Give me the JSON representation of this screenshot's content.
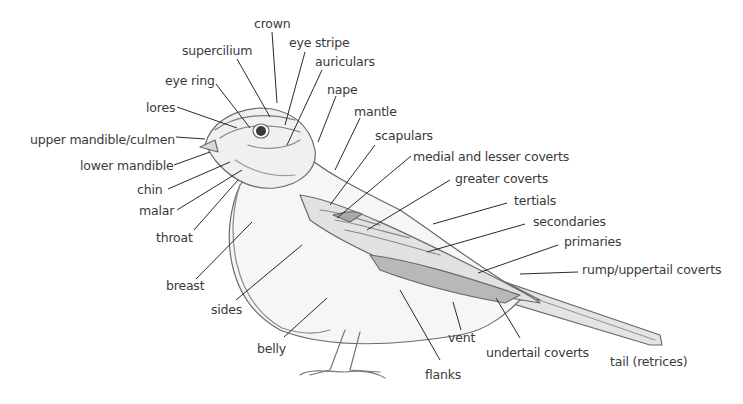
{
  "diagram": {
    "labels": [
      {
        "id": "crown",
        "text": "crown",
        "x": 254,
        "y": 18
      },
      {
        "id": "supercilium",
        "text": "supercilium",
        "x": 182,
        "y": 45
      },
      {
        "id": "eye-stripe",
        "text": "eye stripe",
        "x": 289,
        "y": 37
      },
      {
        "id": "auriculars",
        "text": "auriculars",
        "x": 315,
        "y": 56
      },
      {
        "id": "eye-ring",
        "text": "eye ring",
        "x": 165,
        "y": 75
      },
      {
        "id": "nape",
        "text": "nape",
        "x": 327,
        "y": 84
      },
      {
        "id": "lores",
        "text": "lores",
        "x": 146,
        "y": 102
      },
      {
        "id": "mantle",
        "text": "mantle",
        "x": 354,
        "y": 106
      },
      {
        "id": "upper-mandible",
        "text": "upper mandible/culmen",
        "x": 30,
        "y": 134
      },
      {
        "id": "scapulars",
        "text": "scapulars",
        "x": 375,
        "y": 130
      },
      {
        "id": "medial-lesser-coverts",
        "text": "medial and lesser coverts",
        "x": 413,
        "y": 151
      },
      {
        "id": "lower-mandible",
        "text": "lower mandible",
        "x": 80,
        "y": 160
      },
      {
        "id": "greater-coverts",
        "text": "greater coverts",
        "x": 455,
        "y": 173
      },
      {
        "id": "chin",
        "text": "chin",
        "x": 137,
        "y": 184
      },
      {
        "id": "tertials",
        "text": "tertials",
        "x": 514,
        "y": 195
      },
      {
        "id": "malar",
        "text": "malar",
        "x": 139,
        "y": 205
      },
      {
        "id": "secondaries",
        "text": "secondaries",
        "x": 533,
        "y": 216
      },
      {
        "id": "throat",
        "text": "throat",
        "x": 156,
        "y": 232
      },
      {
        "id": "primaries",
        "text": "primaries",
        "x": 564,
        "y": 236
      },
      {
        "id": "rump-uppertail-coverts",
        "text": "rump/uppertail coverts",
        "x": 582,
        "y": 264
      },
      {
        "id": "breast",
        "text": "breast",
        "x": 166,
        "y": 280
      },
      {
        "id": "sides",
        "text": "sides",
        "x": 211,
        "y": 304
      },
      {
        "id": "belly",
        "text": "belly",
        "x": 257,
        "y": 343
      },
      {
        "id": "vent",
        "text": "vent",
        "x": 448,
        "y": 332
      },
      {
        "id": "undertail-coverts",
        "text": "undertail coverts",
        "x": 486,
        "y": 347
      },
      {
        "id": "tail-retrices",
        "text": "tail (retrices)",
        "x": 610,
        "y": 356
      },
      {
        "id": "flanks",
        "text": "flanks",
        "x": 425,
        "y": 369
      }
    ]
  }
}
